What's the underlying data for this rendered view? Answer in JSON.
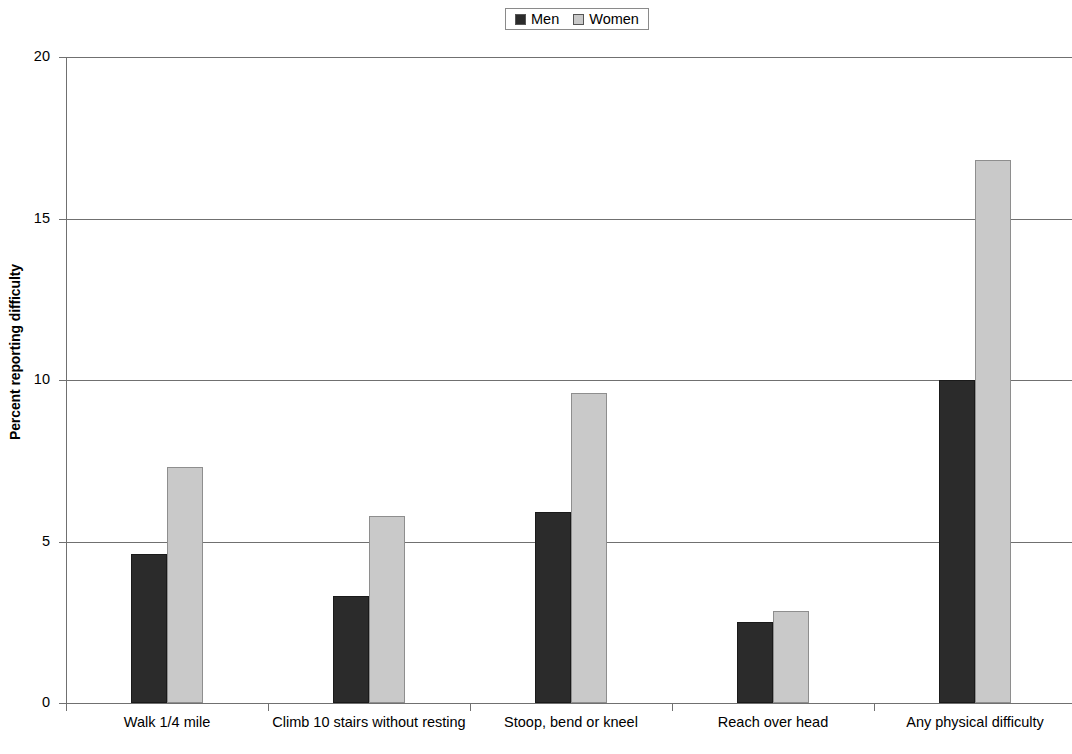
{
  "chart_data": {
    "type": "bar",
    "title": "",
    "xlabel": "",
    "ylabel": "Percent reporting difficulty",
    "categories": [
      "Walk 1/4 mile",
      "Climb 10 stairs without resting",
      "Stoop, bend or kneel",
      "Reach over head",
      "Any physical difficulty"
    ],
    "series": [
      {
        "name": "Men",
        "color": "#2b2b2b",
        "values": [
          4.6,
          3.3,
          5.9,
          2.5,
          10.0
        ]
      },
      {
        "name": "Women",
        "color": "#c9c9c9",
        "values": [
          7.3,
          5.8,
          9.6,
          2.85,
          16.8
        ]
      }
    ],
    "ylim": [
      0,
      20
    ],
    "yticks": [
      0,
      5,
      10,
      15,
      20
    ],
    "ytick_labels": [
      "0",
      "5",
      "10",
      "15",
      "20"
    ],
    "grid": true,
    "legend_position": "top-center"
  },
  "legend": {
    "men_label": "Men",
    "women_label": "Women"
  },
  "axis": {
    "y_title": "Percent reporting difficulty",
    "y_labels": [
      "20",
      "15",
      "10",
      "5",
      "0"
    ]
  },
  "categories": {
    "c0": "Walk 1/4 mile",
    "c1": "Climb 10 stairs without resting",
    "c2": "Stoop, bend or kneel",
    "c3": "Reach over head",
    "c4": "Any physical difficulty"
  }
}
